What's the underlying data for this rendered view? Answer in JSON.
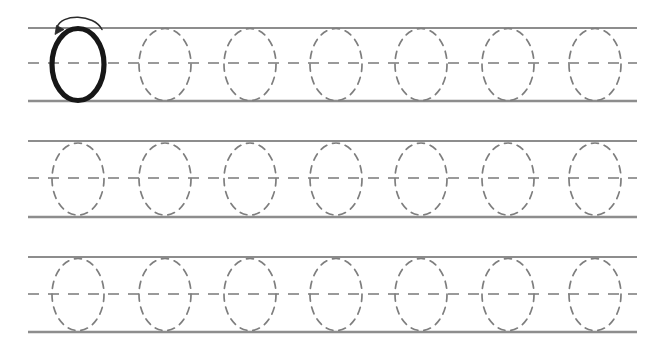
{
  "worksheet": {
    "title": "Letter O tracing practice worksheet",
    "canvas": {
      "width": 667,
      "height": 362,
      "background": "#ffffff"
    },
    "colors": {
      "rule_line": "#8d8d8d",
      "midline_dash": "#9a9a9a",
      "trace_outline": "#7e7e7e",
      "model_letter": "#171717",
      "arrow": "#2b2b2b"
    },
    "letter": "O",
    "guide": {
      "left_x": 28,
      "right_x": 637,
      "top_line_style": "solid",
      "middle_line_style": "dashed",
      "baseline_style": "solid"
    },
    "glyph": {
      "rx": 26,
      "ry": 36,
      "model_stroke_width": 5.2,
      "trace_stroke_width": 1.7,
      "trace_dash": "7 6"
    },
    "rows": [
      {
        "id": "row-1",
        "label": "Practice row 1",
        "top_y": 28,
        "mid_y": 63,
        "base_y": 101,
        "has_model_letter": true,
        "has_stroke_arrow": true,
        "slots": [
          {
            "x": 78,
            "kind": "model"
          },
          {
            "x": 165,
            "kind": "trace"
          },
          {
            "x": 250,
            "kind": "trace"
          },
          {
            "x": 336,
            "kind": "trace"
          },
          {
            "x": 421,
            "kind": "trace"
          },
          {
            "x": 508,
            "kind": "trace"
          },
          {
            "x": 595,
            "kind": "trace"
          }
        ]
      },
      {
        "id": "row-2",
        "label": "Practice row 2",
        "top_y": 141,
        "mid_y": 178,
        "base_y": 217,
        "has_model_letter": false,
        "has_stroke_arrow": false,
        "slots": [
          {
            "x": 78,
            "kind": "trace"
          },
          {
            "x": 165,
            "kind": "trace"
          },
          {
            "x": 250,
            "kind": "trace"
          },
          {
            "x": 336,
            "kind": "trace"
          },
          {
            "x": 421,
            "kind": "trace"
          },
          {
            "x": 508,
            "kind": "trace"
          },
          {
            "x": 595,
            "kind": "trace"
          }
        ]
      },
      {
        "id": "row-3",
        "label": "Practice row 3",
        "top_y": 257,
        "mid_y": 294,
        "base_y": 332,
        "has_model_letter": false,
        "has_stroke_arrow": false,
        "slots": [
          {
            "x": 78,
            "kind": "trace"
          },
          {
            "x": 165,
            "kind": "trace"
          },
          {
            "x": 250,
            "kind": "trace"
          },
          {
            "x": 336,
            "kind": "trace"
          },
          {
            "x": 421,
            "kind": "trace"
          },
          {
            "x": 508,
            "kind": "trace"
          },
          {
            "x": 595,
            "kind": "trace"
          }
        ]
      }
    ]
  }
}
